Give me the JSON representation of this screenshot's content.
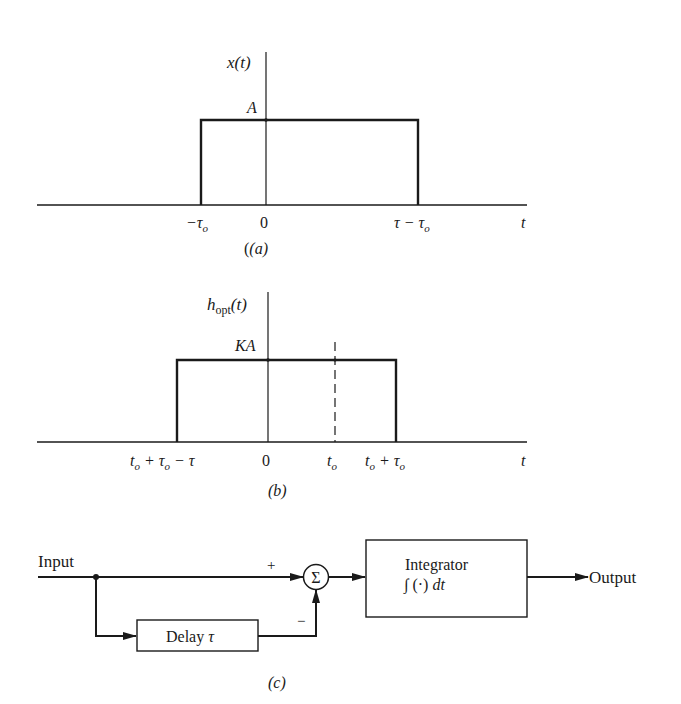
{
  "colors": {
    "ink": "#1a1a1a",
    "paper": "#ffffff"
  },
  "panel_a": {
    "caption": "(a)",
    "y_label": "x(t)",
    "amplitude_label": "A",
    "x_axis_label": "t",
    "ticks": [
      {
        "label_main": "−τ",
        "label_sub": "o"
      },
      {
        "label_main": "0",
        "label_sub": ""
      },
      {
        "label_main": "τ − τ",
        "label_sub": "o"
      }
    ]
  },
  "panel_b": {
    "caption": "(b)",
    "y_label_main": "h",
    "y_label_sub": "opt",
    "y_label_tail": "(t)",
    "amplitude_label": "KA",
    "x_axis_label": "t",
    "ticks": [
      {
        "label": "t_o + τ_o − τ",
        "p1": "t",
        "s1": "o",
        "p2": " + τ",
        "s2": "o",
        "p3": " − τ"
      },
      {
        "label": "0"
      },
      {
        "label": "t_o",
        "p1": "t",
        "s1": "o"
      },
      {
        "label": "t_o + τ_o",
        "p1": "t",
        "s1": "o",
        "p2": " + τ",
        "s2": "o"
      }
    ]
  },
  "panel_c": {
    "caption": "(c)",
    "input_label": "Input",
    "output_label": "Output",
    "plus_sign": "+",
    "minus_sign": "−",
    "sum_symbol": "Σ",
    "delay_block": {
      "label": "Delay",
      "param": "τ"
    },
    "integrator_block": {
      "title": "Integrator",
      "formula_int": "∫",
      "formula_body": "(·)",
      "formula_dt": "dt"
    }
  }
}
